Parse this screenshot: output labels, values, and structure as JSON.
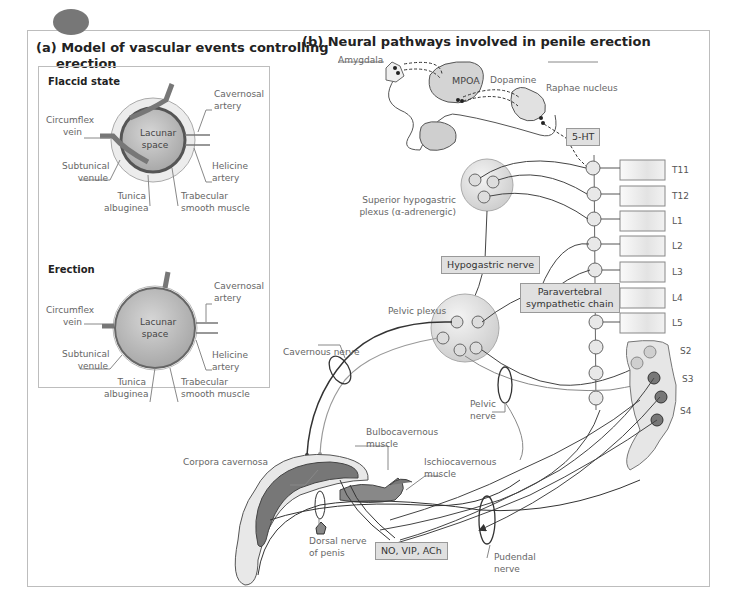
{
  "panel_a": {
    "title_line1": "(a) Model of vascular events controlling",
    "title_line2": "erection",
    "flaccid": {
      "title": "Flaccid state",
      "labels": {
        "cavernosal_artery": [
          "Cavernosal",
          "artery"
        ],
        "circumflex_vein": [
          "Circumflex",
          "vein"
        ],
        "lacunar_space": [
          "Lacunar",
          "space"
        ],
        "subtunical_venule": [
          "Subtunical",
          "venule"
        ],
        "helicine_artery": [
          "Helicine",
          "artery"
        ],
        "tunica_albuginea": [
          "Tunica",
          "albuginea"
        ],
        "trabecular_smooth_muscle": [
          "Trabecular",
          "smooth muscle"
        ]
      }
    },
    "erection": {
      "title": "Erection",
      "labels": {
        "cavernosal_artery": [
          "Cavernosal",
          "artery"
        ],
        "circumflex_vein": [
          "Circumflex",
          "vein"
        ],
        "lacunar_space": [
          "Lacunar",
          "space"
        ],
        "subtunical_venule": [
          "Subtunical",
          "venule"
        ],
        "helicine_artery": [
          "Helicine",
          "artery"
        ],
        "tunica_albuginea": [
          "Tunica",
          "albuginea"
        ],
        "trabecular_smooth_muscle": [
          "Trabecular",
          "smooth muscle"
        ]
      }
    }
  },
  "panel_b": {
    "title": "(b) Neural pathways involved in penile erection",
    "brain": {
      "amygdala": "Amygdala",
      "mpoa": "MPOA",
      "dopamine": "Dopamine",
      "raphae_nucleus": "Raphae nucleus",
      "serotonin": "5-HT"
    },
    "spinal_segments": [
      "T11",
      "T12",
      "L1",
      "L2",
      "L3",
      "L4",
      "L5"
    ],
    "sacral_segments": [
      "S2",
      "S3",
      "S4"
    ],
    "labels": {
      "superior_hypogastric_1": "Superior hypogastric",
      "superior_hypogastric_2": "plexus (α-adrenergic)",
      "hypogastric_nerve": "Hypogastric nerve",
      "paravertebral_1": "Paravertebral",
      "paravertebral_2": "sympathetic chain",
      "pelvic_plexus": "Pelvic plexus",
      "cavernous_nerve": "Cavernous nerve",
      "pelvic_nerve_1": "Pelvic",
      "pelvic_nerve_2": "nerve",
      "bulbocavernous_1": "Bulbocavernous",
      "bulbocavernous_2": "muscle",
      "ischiocavernous_1": "Ischiocavernous",
      "ischiocavernous_2": "muscle",
      "corpora_cavernosa": "Corpora cavernosa",
      "dorsal_nerve_1": "Dorsal nerve",
      "dorsal_nerve_2": "of penis",
      "neurotransmitters": "NO, VIP, ACh",
      "pudendal_1": "Pudendal",
      "pudendal_2": "nerve"
    }
  },
  "colors": {
    "frame": "#bdbdbd",
    "tissue_fill": "#c8c8c8",
    "dark_tissue": "#7a7a7a",
    "label_box": "#e0e0e0",
    "nerve_line": "#444444",
    "text": "#555555"
  }
}
